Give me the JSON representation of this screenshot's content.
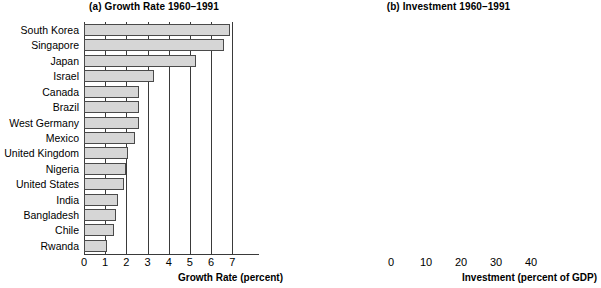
{
  "chart_data": [
    {
      "type": "bar",
      "orientation": "horizontal",
      "panel_label": "(a)",
      "title": "(a) Growth Rate 1960–1991",
      "xlabel": "Growth Rate (percent)",
      "ylabel": "",
      "xlim": [
        0,
        7.6
      ],
      "xticks": [
        0,
        1,
        2,
        3,
        4,
        5,
        6,
        7
      ],
      "xticklabels": [
        "0",
        "1",
        "2",
        "3",
        "4",
        "5",
        "6",
        "7"
      ],
      "grid": "vertical",
      "legend": "none",
      "categories": [
        "South Korea",
        "Singapore",
        "Japan",
        "Israel",
        "Canada",
        "Brazil",
        "West Germany",
        "Mexico",
        "United Kingdom",
        "Nigeria",
        "United States",
        "India",
        "Bangladesh",
        "Chile",
        "Rwanda"
      ],
      "values": [
        6.9,
        6.6,
        5.3,
        3.3,
        2.6,
        2.6,
        2.6,
        2.4,
        2.1,
        2.0,
        1.9,
        1.6,
        1.5,
        1.4,
        1.1
      ],
      "bar_facecolor": "#d6d6d6",
      "bar_edgecolor": "#4a4a4a"
    },
    {
      "type": "bar",
      "orientation": "horizontal",
      "panel_label": "(b)",
      "title": "(b) Investment 1960–1991",
      "xlabel": "Investment (percent of GDP)",
      "ylabel": "",
      "xlim": [
        0,
        50
      ],
      "xticks": [
        0,
        10,
        20,
        30,
        40
      ],
      "xticklabels": [
        "0",
        "10",
        "20",
        "30",
        "40"
      ],
      "grid": "vertical",
      "legend": "none",
      "categories": [
        "South Korea",
        "Singapore",
        "Japan",
        "Israel",
        "Canada",
        "Brazil",
        "West Germany",
        "Mexico",
        "United Kingdom",
        "Nigeria",
        "United States",
        "India",
        "Bangladesh",
        "Chile",
        "Rwanda"
      ],
      "values": [
        24,
        31,
        35,
        26,
        24,
        19.5,
        28,
        16,
        17.5,
        12,
        21,
        14,
        4.5,
        20,
        4
      ],
      "bar_facecolor": "#d6d6d6",
      "bar_edgecolor": "#4a4a4a"
    }
  ],
  "panel_a": {
    "title": "(a) Growth Rate 1960–1991",
    "axis_title": "Growth Rate (percent)",
    "ticks": [
      "0",
      "1",
      "2",
      "3",
      "4",
      "5",
      "6",
      "7"
    ],
    "rows": [
      {
        "label": "South Korea",
        "value": 6.9
      },
      {
        "label": "Singapore",
        "value": 6.6
      },
      {
        "label": "Japan",
        "value": 5.3
      },
      {
        "label": "Israel",
        "value": 3.3
      },
      {
        "label": "Canada",
        "value": 2.6
      },
      {
        "label": "Brazil",
        "value": 2.6
      },
      {
        "label": "West Germany",
        "value": 2.6
      },
      {
        "label": "Mexico",
        "value": 2.4
      },
      {
        "label": "United Kingdom",
        "value": 2.1
      },
      {
        "label": "Nigeria",
        "value": 2.0
      },
      {
        "label": "United States",
        "value": 1.9
      },
      {
        "label": "India",
        "value": 1.6
      },
      {
        "label": "Bangladesh",
        "value": 1.5
      },
      {
        "label": "Chile",
        "value": 1.4
      },
      {
        "label": "Rwanda",
        "value": 1.1
      }
    ]
  },
  "panel_b": {
    "title": "(b) Investment 1960–1991",
    "axis_title": "Investment (percent of GDP)",
    "ticks": [
      "0",
      "10",
      "20",
      "30",
      "40"
    ],
    "rows": [
      {
        "label": "South Korea",
        "value": 24
      },
      {
        "label": "Singapore",
        "value": 31
      },
      {
        "label": "Japan",
        "value": 35
      },
      {
        "label": "Israel",
        "value": 26
      },
      {
        "label": "Canada",
        "value": 24
      },
      {
        "label": "Brazil",
        "value": 19.5
      },
      {
        "label": "West Germany",
        "value": 28
      },
      {
        "label": "Mexico",
        "value": 16
      },
      {
        "label": "United Kingdom",
        "value": 17.5
      },
      {
        "label": "Nigeria",
        "value": 12
      },
      {
        "label": "United States",
        "value": 21
      },
      {
        "label": "India",
        "value": 14
      },
      {
        "label": "Bangladesh",
        "value": 4.5
      },
      {
        "label": "Chile",
        "value": 20
      },
      {
        "label": "Rwanda",
        "value": 4
      }
    ]
  },
  "colors": {
    "bar_fill": "#d6d6d6",
    "bar_edge": "#4a4a4a",
    "grid": "#3a3a3a",
    "text": "#000000",
    "background": "#ffffff"
  }
}
